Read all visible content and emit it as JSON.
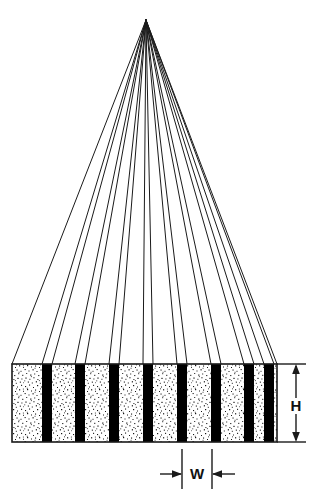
{
  "diagram": {
    "background_color": "#ffffff",
    "line_color": "#1a1a1a",
    "stripe_dark_color": "#000000",
    "stripe_light_color": "#ffffff",
    "stipple_dot_color": "#1a1a1a"
  },
  "apex": {
    "label": "convergence-apex",
    "x": 146,
    "y": 20
  },
  "bar": {
    "label": "striped-bar",
    "left": 12,
    "right": 277,
    "top": 364,
    "bottom": 442,
    "height_px": 78,
    "width_px": 265,
    "stripe_period_px": 33.5,
    "dark_stripe_width_px": 10,
    "dark_stripe_count": 8,
    "light_stripe_count": 9,
    "dark_stripes": [
      {
        "index": 1,
        "x": 42,
        "width": 10
      },
      {
        "index": 2,
        "x": 75,
        "width": 10
      },
      {
        "index": 3,
        "x": 109,
        "width": 10
      },
      {
        "index": 4,
        "x": 143,
        "width": 10
      },
      {
        "index": 5,
        "x": 177,
        "width": 10
      },
      {
        "index": 6,
        "x": 211,
        "width": 10
      },
      {
        "index": 7,
        "x": 244,
        "width": 10
      },
      {
        "index": 8,
        "x": 264,
        "width": 10
      }
    ]
  },
  "rays": {
    "label": "convergent-ray-fan",
    "count": 18,
    "origin_x": 146,
    "origin_y": 20,
    "terminate_y": 364,
    "terminate_x_values": [
      12,
      42,
      52,
      75,
      85,
      109,
      119,
      143,
      153,
      177,
      187,
      211,
      221,
      244,
      254,
      264,
      274,
      277
    ]
  },
  "dimensions": {
    "height": {
      "symbol": "H",
      "name": "height-dimension",
      "axis": "vertical",
      "line_x": 296,
      "from_y": 364,
      "to_y": 442,
      "label_x": 296,
      "label_y": 407,
      "extension_top_y": 364,
      "extension_bottom_y": 442,
      "extension_from_x": 277,
      "extension_to_x": 306
    },
    "width": {
      "symbol": "W",
      "name": "width-dimension",
      "axis": "horizontal",
      "line_y": 474,
      "from_x": 160,
      "to_x": 235,
      "ext_left_x": 182,
      "ext_right_x": 212,
      "label_x": 197,
      "label_y": 479,
      "extension_top_y": 446,
      "extension_bottom_y": 488
    }
  }
}
